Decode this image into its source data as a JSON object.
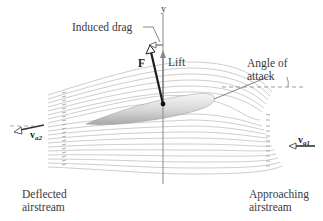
{
  "diagram": {
    "labels": {
      "induced_drag": "Induced drag",
      "y_axis": "y",
      "force": "F",
      "lift": "Lift",
      "angle_of_attack_line1": "Angle of",
      "angle_of_attack_line2": "attack",
      "v_deflected": "v",
      "v_deflected_sub": "a2",
      "v_approaching": "v",
      "v_approaching_sub": "a1",
      "deflected_line1": "Deflected",
      "deflected_line2": "airstream",
      "approaching_line1": "Approaching",
      "approaching_line2": "airstream"
    },
    "colors": {
      "streamline": "#b5b5b5",
      "vector": "#1e1e1e",
      "axis": "#777777",
      "airfoil_light": "#f4f4f4",
      "airfoil_dark": "#a9a9a9",
      "text": "#3a3a3a"
    }
  }
}
